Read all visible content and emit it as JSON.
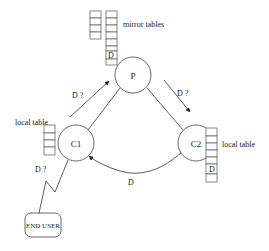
{
  "diagram": {
    "nodes": {
      "p": {
        "label": "P"
      },
      "c1": {
        "label": "C1"
      },
      "c2": {
        "label": "C2"
      },
      "end_user": {
        "label": "END USER"
      }
    },
    "tables": {
      "mirror": {
        "label": "mirror tables",
        "entry": "D"
      },
      "local_c1": {
        "label": "local table"
      },
      "local_c2": {
        "label": "local table",
        "entry": "D"
      }
    },
    "edges": {
      "c1_to_p": {
        "label": "D ?"
      },
      "p_to_c2": {
        "label": "D ?"
      },
      "c2_to_c1": {
        "label": "D"
      },
      "user_to_c1": {
        "label": "D ?"
      }
    }
  }
}
